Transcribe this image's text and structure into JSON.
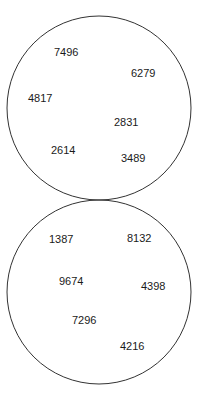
{
  "circles": [
    {
      "name": "top",
      "cx": 99,
      "cy": 108,
      "r": 92,
      "numbers": [
        {
          "value": "7496",
          "x": 54,
          "y": 56
        },
        {
          "value": "6279",
          "x": 131,
          "y": 77
        },
        {
          "value": "4817",
          "x": 28,
          "y": 102
        },
        {
          "value": "2831",
          "x": 114,
          "y": 126
        },
        {
          "value": "2614",
          "x": 51,
          "y": 154
        },
        {
          "value": "3489",
          "x": 121,
          "y": 162
        }
      ]
    },
    {
      "name": "bottom",
      "cx": 99,
      "cy": 292,
      "r": 92,
      "numbers": [
        {
          "value": "1387",
          "x": 49,
          "y": 243
        },
        {
          "value": "8132",
          "x": 127,
          "y": 242
        },
        {
          "value": "9674",
          "x": 59,
          "y": 285
        },
        {
          "value": "4398",
          "x": 141,
          "y": 290
        },
        {
          "value": "7296",
          "x": 72,
          "y": 324
        },
        {
          "value": "4216",
          "x": 120,
          "y": 350
        }
      ]
    }
  ],
  "stroke_color": "#333333"
}
